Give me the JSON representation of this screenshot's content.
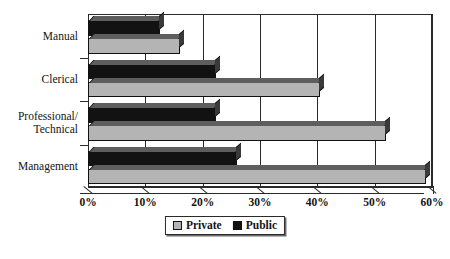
{
  "chart_data": {
    "type": "bar",
    "orientation": "horizontal",
    "title": "",
    "xlabel": "",
    "ylabel": "",
    "categories": [
      "Manual",
      "Clerical",
      "Professional/\nTechnical",
      "Management"
    ],
    "series": [
      {
        "name": "Private",
        "color": "#b4b4b4",
        "values": [
          16.0,
          40.5,
          52.0,
          59.0
        ]
      },
      {
        "name": "Public",
        "color": "#121212",
        "values": [
          12.5,
          22.3,
          22.3,
          26.0
        ]
      }
    ],
    "xlim": [
      0,
      60
    ],
    "xticks": [
      0,
      10,
      20,
      30,
      40,
      50,
      60
    ],
    "xtick_labels": [
      "0%",
      "10%",
      "20%",
      "30%",
      "40%",
      "50%",
      "60%"
    ],
    "grid": true,
    "grid_axis": "x",
    "legend_position": "bottom",
    "style": "3d-bar"
  },
  "legend": {
    "items": [
      {
        "label": "Private",
        "swatch": "private-swatch"
      },
      {
        "label": "Public",
        "swatch": "public-swatch"
      }
    ]
  }
}
